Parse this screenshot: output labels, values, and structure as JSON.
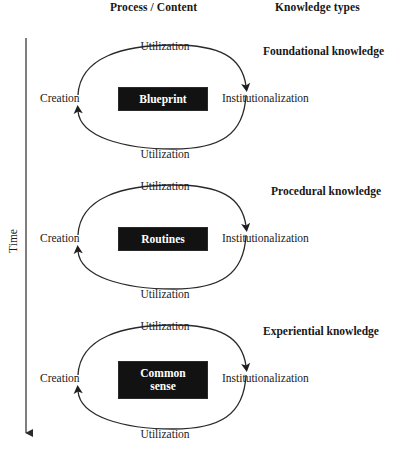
{
  "headers": {
    "process": "Process / Content",
    "knowledge": "Knowledge types"
  },
  "axis": {
    "time_label": "Time",
    "direction": "downward"
  },
  "labels": {
    "utilization": "Utilization",
    "creation": "Creation",
    "institutionalization": "Institutionalization"
  },
  "colors": {
    "box_fill": "#121212",
    "box_text": "#ffffff",
    "stroke": "#1a1a1a",
    "text": "#1a1a1a"
  },
  "cycles": [
    {
      "center": "Blueprint",
      "center_lines": [
        "Blueprint"
      ],
      "knowledge_type": "Foundational knowledge",
      "utilization_top": "Utilization",
      "utilization_bottom": "Utilization",
      "creation": "Creation",
      "institutionalization": "Institutionalization"
    },
    {
      "center": "Routines",
      "center_lines": [
        "Routines"
      ],
      "knowledge_type": "Procedural knowledge",
      "utilization_top": "Utilization",
      "utilization_bottom": "Utilization",
      "creation": "Creation",
      "institutionalization": "Institutionalization"
    },
    {
      "center": "Common sense",
      "center_lines": [
        "Common",
        "sense"
      ],
      "knowledge_type": "Experiential knowledge",
      "utilization_top": "Utilization",
      "utilization_bottom": "Utilization",
      "creation": "Creation",
      "institutionalization": "Institutionalization"
    }
  ]
}
